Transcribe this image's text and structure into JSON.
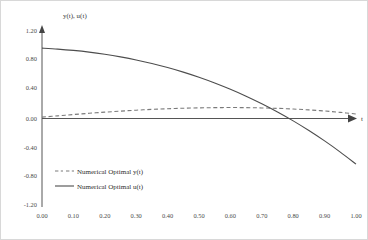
{
  "chart_data": {
    "type": "line",
    "title": "",
    "xlabel": "t",
    "ylabel": "y(t), u(t)",
    "xlim": [
      0.0,
      1.0
    ],
    "ylim": [
      -1.2,
      1.2
    ],
    "grid": false,
    "legend_position": "lower-left-inside",
    "x_ticks": [
      "0.00",
      "0.10",
      "0.20",
      "0.30",
      "0.40",
      "0.50",
      "0.60",
      "0.70",
      "0.80",
      "0.90",
      "1.00"
    ],
    "y_ticks": [
      "1.20",
      "0.80",
      "0.40",
      "0.00",
      "-0.40",
      "-0.80",
      "-1.20"
    ],
    "x": [
      0.0,
      0.05,
      0.1,
      0.15,
      0.2,
      0.25,
      0.3,
      0.35,
      0.4,
      0.45,
      0.5,
      0.55,
      0.6,
      0.65,
      0.7,
      0.75,
      0.8,
      0.85,
      0.9,
      0.95,
      1.0
    ],
    "series": [
      {
        "name": "Numerical Optimal y(t)",
        "style": "dashed",
        "color": "#7a7a7a",
        "values": [
          0.0,
          0.018,
          0.036,
          0.053,
          0.069,
          0.083,
          0.096,
          0.107,
          0.116,
          0.123,
          0.128,
          0.131,
          0.132,
          0.131,
          0.127,
          0.121,
          0.112,
          0.1,
          0.085,
          0.066,
          0.043
        ]
      },
      {
        "name": "Numerical Optimal u(t)",
        "style": "solid",
        "color": "#4d4d4d",
        "values": [
          0.95,
          0.937,
          0.919,
          0.896,
          0.866,
          0.83,
          0.788,
          0.739,
          0.683,
          0.62,
          0.549,
          0.47,
          0.383,
          0.288,
          0.184,
          0.071,
          -0.051,
          -0.184,
          -0.327,
          -0.481,
          -0.646
        ]
      }
    ]
  },
  "legend": {
    "entries": [
      {
        "label": "Numerical Optimal y(t)",
        "style": "dashed"
      },
      {
        "label": "Numerical Optimal u(t)",
        "style": "solid"
      }
    ]
  }
}
